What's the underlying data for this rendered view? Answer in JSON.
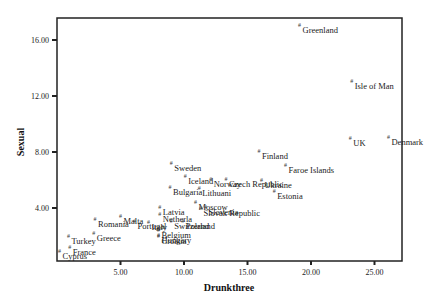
{
  "chart_data": {
    "type": "scatter",
    "title": "",
    "xlabel": "Drunkthree",
    "ylabel": "Sexual",
    "xlim": [
      0,
      27.0
    ],
    "ylim": [
      0.2,
      17.5
    ],
    "xticks": [
      5,
      10,
      15,
      20,
      25
    ],
    "yticks": [
      4,
      8,
      12,
      16
    ],
    "xtick_labels": [
      "5.00",
      "10.00",
      "15.00",
      "20.00",
      "25.00"
    ],
    "ytick_labels": [
      "4.00",
      "8.00",
      "12.00",
      "16.00"
    ],
    "grid": false,
    "legend": "none",
    "marker": "#",
    "points": [
      {
        "label": "Greenland",
        "x": 19.1,
        "y": 17.1
      },
      {
        "label": "Isle of Man",
        "x": 23.2,
        "y": 13.1
      },
      {
        "label": "UK",
        "x": 23.1,
        "y": 9.0
      },
      {
        "label": "Denmark",
        "x": 26.1,
        "y": 9.1
      },
      {
        "label": "Finland",
        "x": 15.9,
        "y": 8.1
      },
      {
        "label": "Faroe Islands",
        "x": 18.0,
        "y": 7.1
      },
      {
        "label": "Ukraine",
        "x": 16.1,
        "y": 6.0
      },
      {
        "label": "Estonia",
        "x": 17.1,
        "y": 5.2
      },
      {
        "label": "Sweden",
        "x": 9.0,
        "y": 7.2
      },
      {
        "label": "Iceland",
        "x": 10.1,
        "y": 6.3
      },
      {
        "label": "Norway",
        "x": 12.1,
        "y": 6.1
      },
      {
        "label": "Czech Republic",
        "x": 13.3,
        "y": 6.1
      },
      {
        "label": "Lithuani",
        "x": 11.2,
        "y": 5.4
      },
      {
        "label": "Bulgaria",
        "x": 8.9,
        "y": 5.5
      },
      {
        "label": "Moscow",
        "x": 10.9,
        "y": 4.4
      },
      {
        "label": "Slovenia",
        "x": 11.7,
        "y": 4.1
      },
      {
        "label": "Slovak Republic",
        "x": 11.3,
        "y": 4.0
      },
      {
        "label": "Latvia",
        "x": 8.1,
        "y": 4.1
      },
      {
        "label": "Netherla",
        "x": 8.1,
        "y": 3.6
      },
      {
        "label": "Switzerland",
        "x": 9.0,
        "y": 3.1
      },
      {
        "label": "Poland",
        "x": 9.9,
        "y": 3.1
      },
      {
        "label": "Italy",
        "x": 7.2,
        "y": 3.0
      },
      {
        "label": "Belgium",
        "x": 8.0,
        "y": 2.4
      },
      {
        "label": "Hungary",
        "x": 8.0,
        "y": 2.1
      },
      {
        "label": "Croatia",
        "x": 8.0,
        "y": 2.0
      },
      {
        "label": "Malta",
        "x": 5.0,
        "y": 3.4
      },
      {
        "label": "Romania",
        "x": 3.0,
        "y": 3.2
      },
      {
        "label": "Greece",
        "x": 2.9,
        "y": 2.2
      },
      {
        "label": "Portugal",
        "x": 6.1,
        "y": 3.1
      },
      {
        "label": "Turkey",
        "x": 0.9,
        "y": 2.0
      },
      {
        "label": "France",
        "x": 1.0,
        "y": 1.2
      },
      {
        "label": "Cyprus",
        "x": 0.2,
        "y": 0.9
      }
    ]
  }
}
